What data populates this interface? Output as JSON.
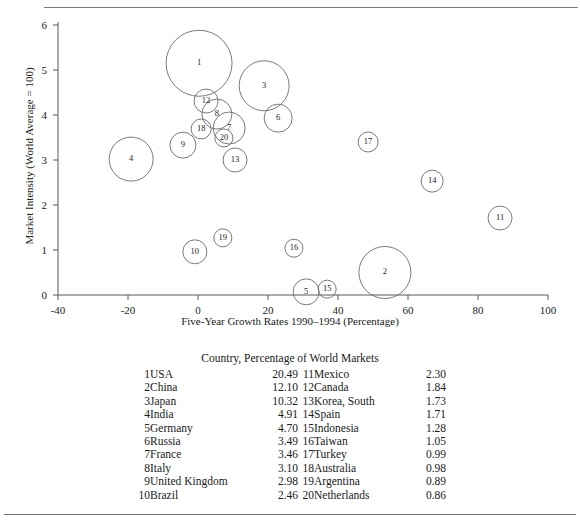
{
  "chart_data": {
    "type": "scatter",
    "title": "",
    "xlabel": "Five-Year Growth Rates 1990–1994 (Percentage)",
    "ylabel": "Market Intensity (World Average = 100)",
    "xlim": [
      -40,
      100
    ],
    "ylim": [
      0,
      6
    ],
    "xticks": [
      "-40",
      "-20",
      "0",
      "20",
      "40",
      "60",
      "80",
      "100"
    ],
    "xtick_values": [
      -40,
      -20,
      0,
      20,
      40,
      60,
      80,
      100
    ],
    "yticks": [
      "0",
      "1",
      "2",
      "3",
      "4",
      "5",
      "6"
    ],
    "ytick_values": [
      0,
      1,
      2,
      3,
      4,
      5,
      6
    ],
    "grid": false,
    "legend_position": "below-plot",
    "size_encodes": "Percentage of World Markets",
    "points": [
      {
        "label": "1",
        "country": "USA",
        "x": 0.3,
        "y": 5.15,
        "size": 20.49,
        "r_px": 33
      },
      {
        "label": "2",
        "country": "China",
        "x": 53.4,
        "y": 0.5,
        "size": 12.1,
        "r_px": 26
      },
      {
        "label": "3",
        "country": "Japan",
        "x": 18.9,
        "y": 4.65,
        "size": 10.32,
        "r_px": 25
      },
      {
        "label": "4",
        "country": "India",
        "x": -19.1,
        "y": 3.02,
        "size": 4.91,
        "r_px": 22
      },
      {
        "label": "5",
        "country": "Germany",
        "x": 30.9,
        "y": 0.07,
        "size": 4.7,
        "r_px": 13
      },
      {
        "label": "6",
        "country": "Russia",
        "x": 22.9,
        "y": 3.93,
        "size": 3.49,
        "r_px": 14
      },
      {
        "label": "7",
        "country": "France",
        "x": 8.9,
        "y": 3.71,
        "size": 3.46,
        "r_px": 16
      },
      {
        "label": "8",
        "country": "Italy",
        "x": 5.4,
        "y": 4.02,
        "size": 3.1,
        "r_px": 15
      },
      {
        "label": "9",
        "country": "United Kingdom",
        "x": -4.3,
        "y": 3.33,
        "size": 2.98,
        "r_px": 13
      },
      {
        "label": "10",
        "country": "Brazil",
        "x": -0.9,
        "y": 0.96,
        "size": 2.46,
        "r_px": 12
      },
      {
        "label": "11",
        "country": "Mexico",
        "x": 86.3,
        "y": 1.71,
        "size": 2.3,
        "r_px": 12
      },
      {
        "label": "12",
        "country": "Canada",
        "x": 2.3,
        "y": 4.31,
        "size": 1.84,
        "r_px": 12
      },
      {
        "label": "13",
        "country": "Korea, South",
        "x": 10.6,
        "y": 3.0,
        "size": 1.73,
        "r_px": 12
      },
      {
        "label": "14",
        "country": "Spain",
        "x": 66.9,
        "y": 2.53,
        "size": 1.71,
        "r_px": 11
      },
      {
        "label": "15",
        "country": "Indonesia",
        "x": 36.9,
        "y": 0.13,
        "size": 1.28,
        "r_px": 9
      },
      {
        "label": "16",
        "country": "Taiwan",
        "x": 27.4,
        "y": 1.04,
        "size": 1.05,
        "r_px": 9
      },
      {
        "label": "17",
        "country": "Turkey",
        "x": 48.6,
        "y": 3.4,
        "size": 0.99,
        "r_px": 10
      },
      {
        "label": "18",
        "country": "Australia",
        "x": 0.9,
        "y": 3.69,
        "size": 0.98,
        "r_px": 10
      },
      {
        "label": "19",
        "country": "Argentina",
        "x": 7.1,
        "y": 1.27,
        "size": 0.89,
        "r_px": 9
      },
      {
        "label": "20",
        "country": "Netherlands",
        "x": 7.4,
        "y": 3.49,
        "size": 0.86,
        "r_px": 9
      }
    ]
  },
  "legend": {
    "title": "Country, Percentage of World Markets",
    "left_column": [
      {
        "index": "1",
        "name": "USA",
        "percent": "20.49"
      },
      {
        "index": "2",
        "name": "China",
        "percent": "12.10"
      },
      {
        "index": "3",
        "name": "Japan",
        "percent": "10.32"
      },
      {
        "index": "4",
        "name": "India",
        "percent": "4.91"
      },
      {
        "index": "5",
        "name": "Germany",
        "percent": "4.70"
      },
      {
        "index": "6",
        "name": "Russia",
        "percent": "3.49"
      },
      {
        "index": "7",
        "name": "France",
        "percent": "3.46"
      },
      {
        "index": "8",
        "name": "Italy",
        "percent": "3.10"
      },
      {
        "index": "9",
        "name": "United Kingdom",
        "percent": "2.98"
      },
      {
        "index": "10",
        "name": "Brazil",
        "percent": "2.46"
      }
    ],
    "right_column": [
      {
        "index": "11",
        "name": "Mexico",
        "percent": "2.30"
      },
      {
        "index": "12",
        "name": "Canada",
        "percent": "1.84"
      },
      {
        "index": "13",
        "name": "Korea, South",
        "percent": "1.73"
      },
      {
        "index": "14",
        "name": "Spain",
        "percent": "1.71"
      },
      {
        "index": "15",
        "name": "Indonesia",
        "percent": "1.28"
      },
      {
        "index": "16",
        "name": "Taiwan",
        "percent": "1.05"
      },
      {
        "index": "17",
        "name": "Turkey",
        "percent": "0.99"
      },
      {
        "index": "18",
        "name": "Australia",
        "percent": "0.98"
      },
      {
        "index": "19",
        "name": "Argentina",
        "percent": "0.89"
      },
      {
        "index": "20",
        "name": "Netherlands",
        "percent": "0.86"
      }
    ]
  },
  "colors": {
    "bubble_stroke": "#6b6b6e",
    "axis": "#58585a",
    "text": "#1d1d1d",
    "rule": "#7a7a7a"
  }
}
